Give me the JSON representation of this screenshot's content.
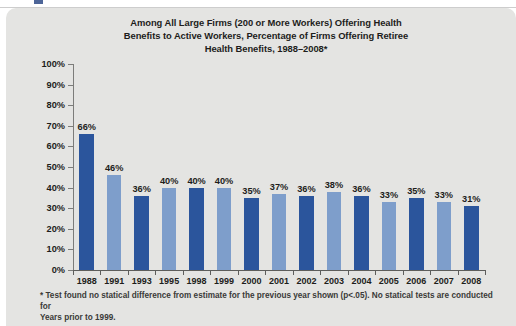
{
  "page": {
    "background_color": "#ffffff",
    "card_background_color": "#e4e4e2"
  },
  "chart_data": {
    "type": "bar",
    "title": "Among All Large Firms (200 or More Workers) Offering Health Benefits to Active Workers, Percentage of Firms Offering Retiree Health Benefits, 1988–2008*",
    "title_lines": [
      "Among All Large Firms (200 or More Workers) Offering Health",
      "Benefits to Active Workers, Percentage of Firms Offering Retiree",
      "Health Benefits, 1988–2008*"
    ],
    "xlabel": "",
    "ylabel": "",
    "ylim": [
      0,
      100
    ],
    "grid": false,
    "legend": "none",
    "categories": [
      "1988",
      "1991",
      "1993",
      "1995",
      "1998",
      "1999",
      "2000",
      "2001",
      "2002",
      "2003",
      "2004",
      "2005",
      "2006",
      "2007",
      "2008"
    ],
    "values": [
      66,
      46,
      36,
      40,
      40,
      40,
      35,
      37,
      36,
      38,
      36,
      33,
      35,
      33,
      31
    ],
    "value_labels": [
      "66%",
      "46%",
      "36%",
      "40%",
      "40%",
      "40%",
      "35%",
      "37%",
      "36%",
      "38%",
      "36%",
      "33%",
      "35%",
      "33%",
      "31%"
    ],
    "bar_colors": [
      "dark",
      "light",
      "dark",
      "light",
      "dark",
      "light",
      "dark",
      "light",
      "dark",
      "light",
      "dark",
      "light",
      "dark",
      "light",
      "dark"
    ],
    "colors": {
      "dark_blue": "#2b559c",
      "light_blue": "#7e9ecb",
      "axis": "#5d5d5b",
      "text": "#1d1d1b"
    },
    "y_ticks": [
      0,
      10,
      20,
      30,
      40,
      50,
      60,
      70,
      80,
      90,
      100
    ],
    "y_tick_labels": [
      "0%",
      "10%",
      "20%",
      "30%",
      "40%",
      "50%",
      "60%",
      "70%",
      "80%",
      "90%",
      "100%"
    ]
  },
  "footnote": {
    "lines": [
      "* Test found no statical difference from estimate for the previous year shown (p<.05). No statical tests are conducted for",
      "Years prior to 1999."
    ]
  }
}
